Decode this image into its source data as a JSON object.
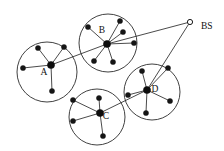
{
  "figure": {
    "background_color": "#ffffff",
    "stroke_color": "#2b2b2b",
    "node_color": "#151515",
    "width": 224,
    "height": 151
  },
  "base_station": {
    "id": "BS",
    "label": "BS",
    "icon": "hollow-circle",
    "x": 190,
    "y": 22,
    "radius": 2.6,
    "label_x": 201,
    "label_y": 29
  },
  "clusters": [
    {
      "id": "A",
      "label": "A",
      "label_x": 44,
      "label_y": 75,
      "circle": {
        "cx": 47,
        "cy": 72,
        "r": 30
      },
      "head": {
        "x": 51,
        "y": 65
      },
      "members": [
        {
          "x": 38,
          "y": 48
        },
        {
          "x": 64,
          "y": 47
        },
        {
          "x": 23,
          "y": 68
        },
        {
          "x": 52,
          "y": 91
        }
      ]
    },
    {
      "id": "B",
      "label": "B",
      "label_x": 102,
      "label_y": 33,
      "circle": {
        "cx": 108,
        "cy": 43,
        "r": 29
      },
      "head": {
        "x": 107,
        "y": 44
      },
      "members": [
        {
          "x": 88,
          "y": 27
        },
        {
          "x": 120,
          "y": 21
        },
        {
          "x": 123,
          "y": 32
        },
        {
          "x": 134,
          "y": 43
        },
        {
          "x": 94,
          "y": 61
        },
        {
          "x": 113,
          "y": 62
        }
      ]
    },
    {
      "id": "C",
      "label": "C",
      "label_x": 106,
      "label_y": 119,
      "circle": {
        "cx": 97,
        "cy": 117,
        "r": 28
      },
      "head": {
        "x": 100,
        "y": 113
      },
      "members": [
        {
          "x": 99,
          "y": 98
        },
        {
          "x": 73,
          "y": 100
        },
        {
          "x": 73,
          "y": 121
        },
        {
          "x": 103,
          "y": 136
        }
      ]
    },
    {
      "id": "D",
      "label": "D",
      "label_x": 155,
      "label_y": 92,
      "circle": {
        "cx": 152,
        "cy": 92,
        "r": 28
      },
      "head": {
        "x": 147,
        "y": 90
      },
      "members": [
        {
          "x": 142,
          "y": 71
        },
        {
          "x": 168,
          "y": 68
        },
        {
          "x": 128,
          "y": 95
        },
        {
          "x": 170,
          "y": 101
        },
        {
          "x": 146,
          "y": 113
        }
      ]
    }
  ],
  "backhaul_links": [
    {
      "from": "B",
      "to": "BS"
    },
    {
      "from": "D",
      "to": "BS"
    },
    {
      "from": "A",
      "to": "B"
    },
    {
      "from": "C",
      "to": "D"
    }
  ]
}
